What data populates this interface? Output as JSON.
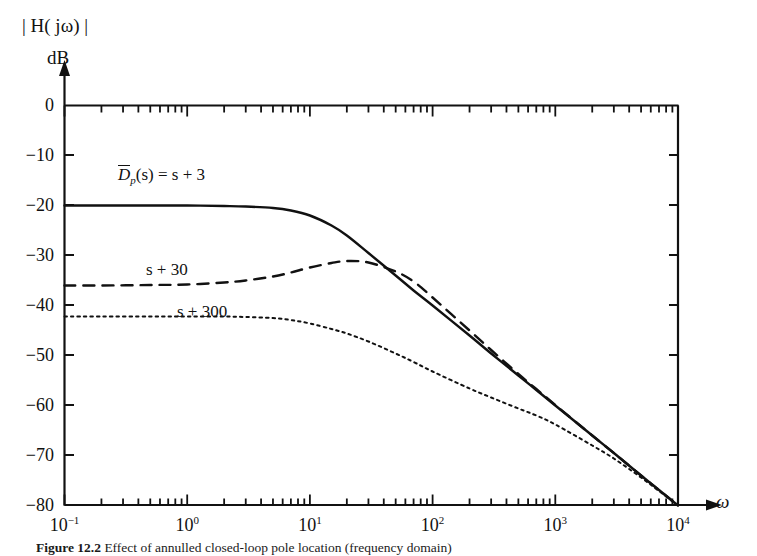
{
  "figure": {
    "caption_number": "Figure 12.2",
    "caption_text": "Effect of annulled closed-loop pole location (frequency domain)"
  },
  "axes": {
    "y_title_line1": "| H( jω) |",
    "y_title_line2": "dB",
    "x_title": "ω",
    "y_ticks": [
      "0",
      "−10",
      "−20",
      "−30",
      "−40",
      "−50",
      "−60",
      "−70",
      "−80"
    ],
    "y_values": [
      0,
      -10,
      -20,
      -30,
      -40,
      -50,
      -60,
      -70,
      -80
    ],
    "x_tick_mantissa": "10",
    "x_tick_exponents": [
      "−1",
      "0",
      "1",
      "2",
      "3",
      "4"
    ],
    "x_values": [
      0.1,
      1,
      10,
      100,
      1000,
      10000
    ]
  },
  "curve_labels": {
    "solid_prefix": "D",
    "solid_subscript": "p",
    "solid_suffix": "(s) = s + 3",
    "dashed": "s + 30",
    "dotted": "s + 300"
  },
  "colors": {
    "axis": "#111111",
    "curve": "#111111",
    "background": "#ffffff"
  },
  "chart_data": {
    "type": "line",
    "title": "",
    "xlabel": "ω",
    "ylabel": "| H( jω) | dB",
    "xscale": "log",
    "xlim": [
      0.1,
      10000
    ],
    "ylim": [
      -80,
      0
    ],
    "grid": false,
    "legend": "inline-curve-labels",
    "annotations": [
      {
        "text": "D̄p(s) = s + 3",
        "x": 1.15,
        "y": -14,
        "style": "solid"
      },
      {
        "text": "s + 30",
        "x": 2.0,
        "y": -32.5,
        "style": "dashed"
      },
      {
        "text": "s + 300",
        "x": 3.6,
        "y": -40.5,
        "style": "dotted"
      }
    ],
    "series": [
      {
        "name": "D̄p(s) = s + 3",
        "style": "solid",
        "dc_gain_db": -20,
        "corner_frequency": 10,
        "slope_db_per_decade": -20,
        "x": [
          0.1,
          0.2,
          0.5,
          1,
          2,
          3,
          5,
          7,
          10,
          15,
          20,
          30,
          50,
          70,
          100,
          200,
          300,
          500,
          700,
          1000,
          2000,
          3000,
          5000,
          7000,
          10000
        ],
        "y": [
          -20.0,
          -20.0,
          -20.0,
          -20.0,
          -20.1,
          -20.2,
          -20.5,
          -21.0,
          -22.0,
          -24.0,
          -26.0,
          -29.5,
          -34.0,
          -37.0,
          -40.0,
          -46.0,
          -49.6,
          -54.0,
          -56.9,
          -60.0,
          -66.0,
          -69.5,
          -74.0,
          -76.9,
          -80.0
        ]
      },
      {
        "name": "s + 30",
        "style": "dashed",
        "dc_gain_db": -36,
        "peak_db": -31,
        "peak_frequency": 20,
        "slope_db_per_decade": -20,
        "x": [
          0.1,
          0.2,
          0.5,
          1,
          2,
          3,
          5,
          7,
          10,
          15,
          20,
          30,
          50,
          70,
          100,
          200,
          300,
          500,
          700,
          1000,
          2000,
          3000,
          5000,
          7000,
          10000
        ],
        "y": [
          -36.0,
          -36.0,
          -35.9,
          -35.8,
          -35.4,
          -35.0,
          -34.2,
          -33.4,
          -32.4,
          -31.5,
          -31.1,
          -31.4,
          -33.2,
          -35.2,
          -38.4,
          -45.0,
          -48.9,
          -53.7,
          -56.7,
          -59.9,
          -66.0,
          -69.5,
          -74.0,
          -76.9,
          -80.0
        ]
      },
      {
        "name": "s + 300",
        "style": "dotted",
        "dc_gain_db": -42,
        "corner_frequency": 8,
        "slope_db_per_decade": -20,
        "x": [
          0.1,
          0.2,
          0.5,
          1,
          2,
          3,
          5,
          7,
          10,
          15,
          20,
          30,
          50,
          70,
          100,
          200,
          300,
          500,
          700,
          1000,
          2000,
          3000,
          5000,
          7000,
          10000
        ],
        "y": [
          -42.2,
          -42.2,
          -42.2,
          -42.2,
          -42.2,
          -42.3,
          -42.5,
          -42.9,
          -43.6,
          -44.7,
          -45.6,
          -47.2,
          -49.6,
          -51.3,
          -53.2,
          -56.6,
          -58.4,
          -60.6,
          -62.0,
          -63.8,
          -68.0,
          -70.6,
          -74.4,
          -77.1,
          -80.0
        ]
      }
    ]
  }
}
